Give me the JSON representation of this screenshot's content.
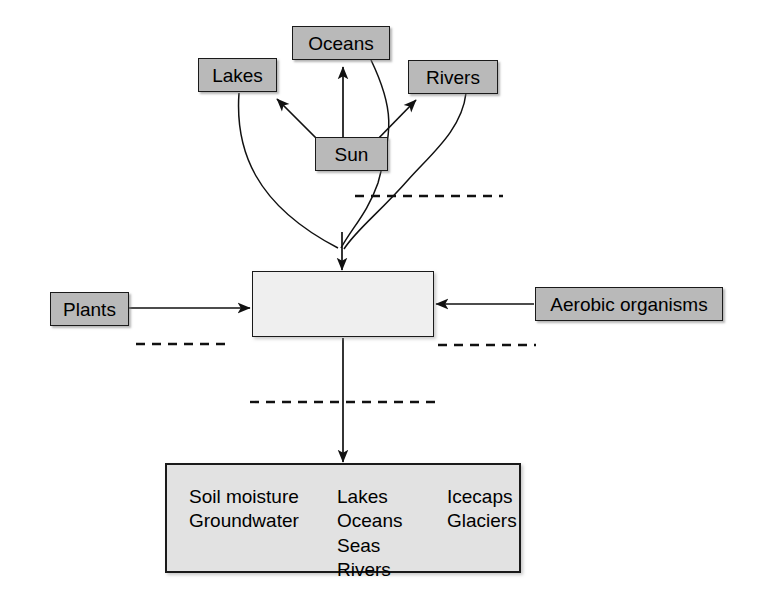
{
  "diagram": {
    "colors": {
      "node_fill": "#b9b9b9",
      "blank_fill": "#efefef",
      "pool_fill": "#e2e2e2",
      "stroke": "#1a1a1a",
      "background": "#ffffff"
    },
    "nodes": {
      "lakes": "Lakes",
      "oceans": "Oceans",
      "rivers": "Rivers",
      "sun": "Sun",
      "plants": "Plants",
      "aerobic": "Aerobic organisms",
      "center": ""
    },
    "reservoirs": {
      "column1": [
        "Soil moisture",
        "Groundwater"
      ],
      "column2": [
        "Lakes",
        "Oceans",
        "Seas",
        "Rivers"
      ],
      "column3": [
        "Icecaps",
        "Glaciers"
      ]
    },
    "blank_labels": {
      "top_right": "",
      "left": "",
      "right": "",
      "below_center": ""
    }
  }
}
